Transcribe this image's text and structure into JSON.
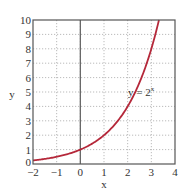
{
  "chart_data": {
    "type": "line",
    "title": "",
    "xlabel": "x",
    "ylabel": "y",
    "xlim": [
      -2,
      4
    ],
    "ylim": [
      0,
      10
    ],
    "xticks": [
      -2,
      -1,
      0,
      1,
      2,
      3,
      4
    ],
    "yticks": [
      0,
      1,
      2,
      3,
      4,
      5,
      6,
      7,
      8,
      9,
      10
    ],
    "xtick_labels": [
      "−2",
      "−1",
      "0",
      "1",
      "2",
      "3",
      "4"
    ],
    "ytick_labels": [
      "0",
      "1",
      "2",
      "3",
      "4",
      "5",
      "6",
      "7",
      "8",
      "9",
      "10"
    ],
    "grid": true,
    "grid_style": "dotted",
    "series": [
      {
        "name": "y = 2^x",
        "function": "2^x",
        "color": "#b5283a",
        "x": [
          -2,
          -1.5,
          -1,
          -0.5,
          0,
          0.5,
          1,
          1.5,
          2,
          2.5,
          3,
          3.32
        ],
        "y": [
          0.25,
          0.354,
          0.5,
          0.707,
          1,
          1.414,
          2,
          2.828,
          4,
          5.657,
          8,
          10
        ]
      }
    ],
    "annotations": [
      {
        "text": "y = 2",
        "superscript": "x",
        "x": 2.1,
        "y": 5
      }
    ],
    "legend": "none",
    "vertical_axis_line_at_x": 0
  },
  "colors": {
    "curve": "#b5283a",
    "frame": "#555555",
    "grid": "#aaaaaa",
    "text": "#333333"
  }
}
